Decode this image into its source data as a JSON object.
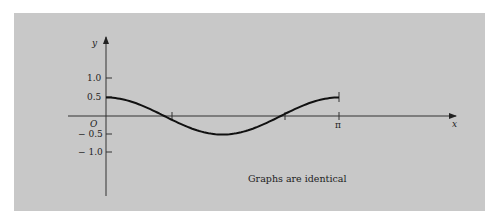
{
  "chart_data": {
    "type": "line",
    "title": "",
    "xlabel": "x",
    "ylabel": "y",
    "origin_label": "O",
    "x_tick_labels": [
      "π"
    ],
    "y_tick_labels": [
      "1.0",
      "0.5",
      "-0.5",
      "-1.0"
    ],
    "xlim": [
      0,
      3.1416
    ],
    "ylim": [
      -1.0,
      1.0
    ],
    "grid": false,
    "series": [
      {
        "name": "y = 0.5 cos 2x",
        "x": [
          0,
          0.3927,
          0.7854,
          1.1781,
          1.5708,
          1.9635,
          2.3562,
          2.7489,
          3.1416
        ],
        "y": [
          0.5,
          0.354,
          0,
          -0.354,
          -0.5,
          -0.354,
          0,
          0.354,
          0.5
        ]
      }
    ],
    "annotations": [
      "Graphs are identical"
    ]
  },
  "labels": {
    "y_axis": "y",
    "x_axis": "x",
    "origin": "O",
    "pi": "π",
    "t1": "1.0",
    "t05": "0.5",
    "tm05": "− 0.5",
    "tm1": "− 1.0",
    "caption": "Graphs are identical"
  }
}
